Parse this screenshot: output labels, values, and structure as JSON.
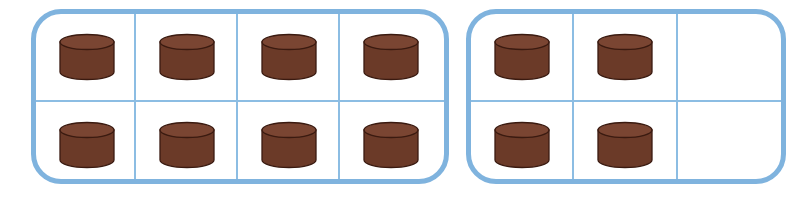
{
  "diagram": {
    "type": "ten-frames",
    "colors": {
      "frame_border": "#7fb3de",
      "grid_line": "#8cbde3",
      "counter_fill": "#6b3a28",
      "counter_top": "#7a4532",
      "counter_outline": "#3a1a10"
    },
    "frames": [
      {
        "name": "frame-1",
        "columns": 4,
        "rows": 2,
        "cells": [
          [
            true,
            true,
            true,
            true
          ],
          [
            true,
            true,
            true,
            true
          ]
        ],
        "count": 8
      },
      {
        "name": "frame-2",
        "columns_visible": 3,
        "rows": 2,
        "cells": [
          [
            true,
            true,
            false
          ],
          [
            true,
            true,
            false
          ]
        ],
        "count": 4
      }
    ],
    "total_counters": 12
  }
}
